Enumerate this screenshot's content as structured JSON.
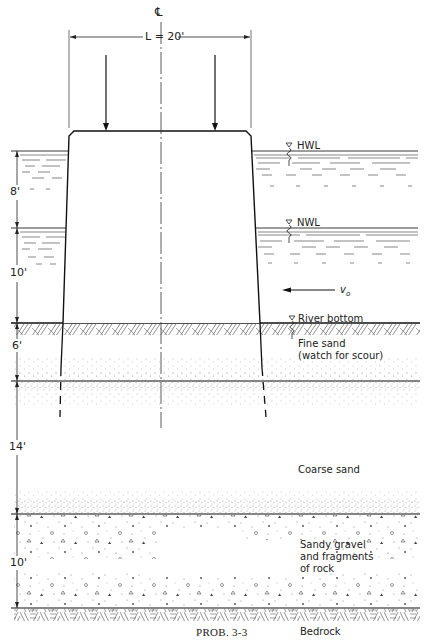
{
  "figure": {
    "caption": "PROB. 3-3",
    "centerline_symbol": "℄",
    "width_label": "L = 20'"
  },
  "water_levels": {
    "hwl": "HWL",
    "nwl": "NWL",
    "river_bottom": "River bottom",
    "velocity": "v",
    "velocity_sub": "o"
  },
  "dimensions": {
    "d1": "8'",
    "d2": "10'",
    "d3": "6'",
    "d4": "14'",
    "d5": "10'"
  },
  "layers": {
    "fine_sand_line1": "Fine sand",
    "fine_sand_line2": "(watch for scour)",
    "coarse_sand": "Coarse sand",
    "gravel_line1": "Sandy gravel",
    "gravel_line2": "and fragments",
    "gravel_line3": "of rock",
    "bedrock": "Bedrock"
  },
  "colors": {
    "ink": "#1a1a1a",
    "stipple": "#555555",
    "background": "#ffffff"
  }
}
